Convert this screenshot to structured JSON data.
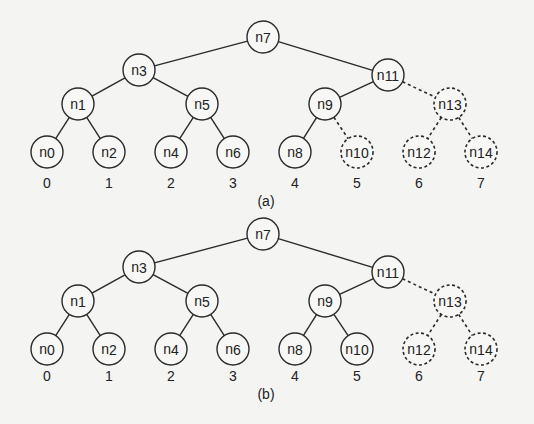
{
  "colors": {
    "background": "#f4f4f2",
    "stroke": "#2a2a2a",
    "text": "#222222",
    "node_fill": "#f7f7f5"
  },
  "nodes": [
    {
      "id": "n7",
      "base": "n",
      "sub": "7",
      "x": 263,
      "y": 37,
      "level": 0
    },
    {
      "id": "n3",
      "base": "n",
      "sub": "3",
      "x": 139,
      "y": 70,
      "level": 1
    },
    {
      "id": "n11",
      "base": "n",
      "sub": "11",
      "x": 388,
      "y": 75,
      "level": 1
    },
    {
      "id": "n1",
      "base": "n",
      "sub": "1",
      "x": 78,
      "y": 104,
      "level": 2
    },
    {
      "id": "n5",
      "base": "n",
      "sub": "5",
      "x": 202,
      "y": 104,
      "level": 2
    },
    {
      "id": "n9",
      "base": "n",
      "sub": "9",
      "x": 325,
      "y": 104,
      "level": 2
    },
    {
      "id": "n13",
      "base": "n",
      "sub": "13",
      "x": 450,
      "y": 104,
      "level": 2
    },
    {
      "id": "n0",
      "base": "n",
      "sub": "0",
      "x": 47,
      "y": 152,
      "level": 3
    },
    {
      "id": "n2",
      "base": "n",
      "sub": "2",
      "x": 109,
      "y": 152,
      "level": 3
    },
    {
      "id": "n4",
      "base": "n",
      "sub": "4",
      "x": 171,
      "y": 152,
      "level": 3
    },
    {
      "id": "n6",
      "base": "n",
      "sub": "6",
      "x": 233,
      "y": 152,
      "level": 3
    },
    {
      "id": "n8",
      "base": "n",
      "sub": "8",
      "x": 295,
      "y": 152,
      "level": 3
    },
    {
      "id": "n10",
      "base": "n",
      "sub": "10",
      "x": 357,
      "y": 152,
      "level": 3
    },
    {
      "id": "n12",
      "base": "n",
      "sub": "12",
      "x": 419,
      "y": 152,
      "level": 3
    },
    {
      "id": "n14",
      "base": "n",
      "sub": "14",
      "x": 481,
      "y": 152,
      "level": 3
    }
  ],
  "edges": [
    [
      "n7",
      "n3"
    ],
    [
      "n7",
      "n11"
    ],
    [
      "n3",
      "n1"
    ],
    [
      "n3",
      "n5"
    ],
    [
      "n11",
      "n9"
    ],
    [
      "n11",
      "n13"
    ],
    [
      "n1",
      "n0"
    ],
    [
      "n1",
      "n2"
    ],
    [
      "n5",
      "n4"
    ],
    [
      "n5",
      "n6"
    ],
    [
      "n9",
      "n8"
    ],
    [
      "n9",
      "n10"
    ],
    [
      "n13",
      "n12"
    ],
    [
      "n13",
      "n14"
    ]
  ],
  "leaf_indices": [
    "0",
    "1",
    "2",
    "3",
    "4",
    "5",
    "6",
    "7"
  ],
  "node_radius": 16,
  "diagrams": [
    {
      "caption": "(a)",
      "offset_y": 0,
      "caption_y": 206,
      "index_y": 188,
      "dashed_nodes": [
        "n10",
        "n12",
        "n13",
        "n14"
      ],
      "dashed_edges": [
        [
          "n11",
          "n13"
        ],
        [
          "n9",
          "n10"
        ],
        [
          "n13",
          "n12"
        ],
        [
          "n13",
          "n14"
        ]
      ]
    },
    {
      "caption": "(b)",
      "offset_y": 197,
      "caption_y": 399,
      "index_y": 381,
      "dashed_nodes": [
        "n12",
        "n13",
        "n14"
      ],
      "dashed_edges": [
        [
          "n11",
          "n13"
        ],
        [
          "n13",
          "n12"
        ],
        [
          "n13",
          "n14"
        ]
      ]
    }
  ]
}
